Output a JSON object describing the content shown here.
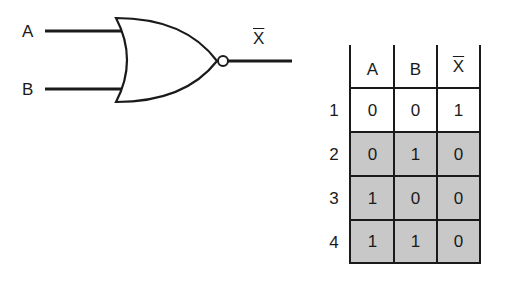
{
  "gate": {
    "type": "NOR",
    "inputs": [
      "A",
      "B"
    ],
    "output_label": "X"
  },
  "truth_table": {
    "headers": [
      "A",
      "B",
      "X"
    ],
    "header_overline": [
      false,
      false,
      true
    ],
    "row_labels": [
      "1",
      "2",
      "3",
      "4"
    ],
    "rows": [
      [
        "0",
        "0",
        "1"
      ],
      [
        "0",
        "1",
        "0"
      ],
      [
        "1",
        "0",
        "0"
      ],
      [
        "1",
        "1",
        "0"
      ]
    ],
    "shaded_rows": [
      2,
      3,
      4
    ],
    "shade_color": "#c8c8c8"
  }
}
